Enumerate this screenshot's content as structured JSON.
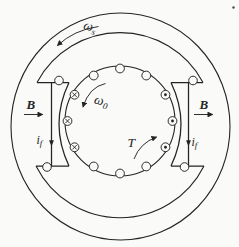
{
  "diagram": {
    "background_color": "#fafaf8",
    "ink_color": "#242424",
    "labels": {
      "stator_speed": {
        "base": "ω",
        "sub": "s"
      },
      "rotor_speed": {
        "base": "ω",
        "sub": "0"
      },
      "flux_left": {
        "base": "B"
      },
      "flux_right": {
        "base": "B"
      },
      "field_current_left": {
        "base": "i",
        "sub": "f"
      },
      "field_current_right": {
        "base": "i",
        "sub": "f"
      },
      "torque": {
        "base": "T"
      }
    },
    "rotor": {
      "conductor_count": 12,
      "conductors": [
        {
          "angle_deg": 0,
          "symbol": "dot"
        },
        {
          "angle_deg": 30,
          "symbol": "dot"
        },
        {
          "angle_deg": 60,
          "symbol": "none"
        },
        {
          "angle_deg": 90,
          "symbol": "none"
        },
        {
          "angle_deg": 120,
          "symbol": "none"
        },
        {
          "angle_deg": 150,
          "symbol": "cross"
        },
        {
          "angle_deg": 180,
          "symbol": "cross"
        },
        {
          "angle_deg": 210,
          "symbol": "cross"
        },
        {
          "angle_deg": 240,
          "symbol": "none"
        },
        {
          "angle_deg": 270,
          "symbol": "none"
        },
        {
          "angle_deg": 300,
          "symbol": "none"
        },
        {
          "angle_deg": 330,
          "symbol": "dot"
        }
      ]
    }
  }
}
